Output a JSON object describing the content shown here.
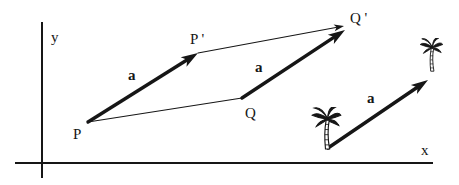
{
  "diagram": {
    "title_hidden": "",
    "ink_color": "#161616",
    "background_color": "#ffffff",
    "canvas": {
      "width": 459,
      "height": 185
    },
    "axes": {
      "y_axis": {
        "name": "y-axis",
        "x": 42,
        "y1": 22,
        "y2": 178,
        "label": "y"
      },
      "x_axis": {
        "name": "x-axis",
        "y": 163,
        "x1": 15,
        "x2": 433,
        "label": "x"
      }
    },
    "thin_segments": [
      {
        "name": "segment-p-to-q",
        "x1": 88,
        "y1": 122,
        "x2": 242,
        "y2": 98,
        "arrow": false
      },
      {
        "name": "segment-p-prime-to-q-prime",
        "x1": 198,
        "y1": 53,
        "x2": 344,
        "y2": 26,
        "arrow": true
      }
    ],
    "vectors": [
      {
        "name": "vector-p-to-p-prime",
        "x1": 88,
        "y1": 122,
        "x2": 198,
        "y2": 53
      },
      {
        "name": "vector-q-to-q-prime",
        "x1": 242,
        "y1": 98,
        "x2": 345,
        "y2": 30
      },
      {
        "name": "vector-a-free",
        "x1": 328,
        "y1": 148,
        "x2": 428,
        "y2": 80
      }
    ],
    "labels": [
      {
        "name": "y-axis-label",
        "text": "y",
        "x": 51,
        "y": 42,
        "bold": false,
        "size": 15
      },
      {
        "name": "x-axis-label",
        "text": "x",
        "x": 421,
        "y": 155,
        "bold": false,
        "size": 15
      },
      {
        "name": "point-label-p",
        "text": "P",
        "x": 73,
        "y": 139,
        "bold": false,
        "size": 15
      },
      {
        "name": "point-label-p-prime",
        "text": "P '",
        "x": 190,
        "y": 44,
        "bold": false,
        "size": 15
      },
      {
        "name": "point-label-q",
        "text": "Q",
        "x": 245,
        "y": 118,
        "bold": false,
        "size": 15
      },
      {
        "name": "point-label-q-prime",
        "text": "Q '",
        "x": 350,
        "y": 23,
        "bold": false,
        "size": 15
      },
      {
        "name": "vector-a-label-1",
        "text": "a",
        "x": 128,
        "y": 80,
        "bold": true,
        "size": 15
      },
      {
        "name": "vector-a-label-2",
        "text": "a",
        "x": 255,
        "y": 72,
        "bold": true,
        "size": 15
      },
      {
        "name": "vector-a-label-3",
        "text": "a",
        "x": 367,
        "y": 103,
        "bold": true,
        "size": 15
      }
    ],
    "palms": [
      {
        "name": "palm-tree-icon-lower",
        "x": 311,
        "y": 107,
        "w": 31,
        "h": 43
      },
      {
        "name": "palm-tree-icon-upper",
        "x": 418,
        "y": 38,
        "w": 27,
        "h": 34
      }
    ],
    "style": {
      "axis_stroke": 2,
      "thin_stroke": 1.1,
      "thick_stroke": 3.4,
      "big_head_len": 17,
      "big_head_halfwidth": 5.5,
      "small_head_len": 10,
      "small_head_halfwidth": 3.4
    }
  }
}
